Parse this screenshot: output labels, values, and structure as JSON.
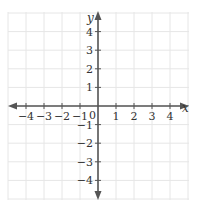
{
  "diagram": {
    "type": "coordinate-plane",
    "x_axis": {
      "name": "x",
      "tick_labels": [
        "−4",
        "−3",
        "−2",
        "−1",
        "1",
        "2",
        "3",
        "4"
      ],
      "tick_values": [
        -4,
        -3,
        -2,
        -1,
        1,
        2,
        3,
        4
      ],
      "range": [
        -5,
        5
      ]
    },
    "y_axis": {
      "name": "y",
      "tick_labels": [
        "4",
        "3",
        "2",
        "1",
        "−1",
        "−2",
        "−3",
        "−4"
      ],
      "tick_values": [
        4,
        3,
        2,
        1,
        -1,
        -2,
        -3,
        -4
      ],
      "range": [
        -5,
        5
      ]
    },
    "origin_label": "0",
    "grid": true,
    "colors": {
      "axis": "#555555",
      "grid": "#e6e6e6",
      "label": "#333333"
    }
  }
}
